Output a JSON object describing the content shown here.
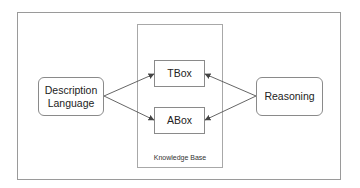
{
  "diagram": {
    "knowledge_base": {
      "label": "Knowledge Base"
    },
    "nodes": {
      "description_language": {
        "line1": "Description",
        "line2": "Language"
      },
      "tbox": {
        "label": "TBox"
      },
      "abox": {
        "label": "ABox"
      },
      "reasoning": {
        "label": "Reasoning"
      }
    },
    "edges": [
      {
        "from": "Description Language",
        "to": "TBox"
      },
      {
        "from": "Description Language",
        "to": "ABox"
      },
      {
        "from": "Reasoning",
        "to": "TBox"
      },
      {
        "from": "Reasoning",
        "to": "ABox"
      }
    ],
    "colors": {
      "border": "#8a8a8a",
      "arrow": "#444444",
      "text": "#222222"
    }
  }
}
